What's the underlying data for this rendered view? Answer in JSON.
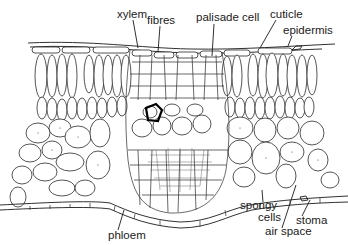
{
  "diagram": {
    "labels": [
      {
        "id": "xylem",
        "text": "xylem",
        "x": 117,
        "y": 18
      },
      {
        "id": "fibres",
        "text": "fibres",
        "x": 147,
        "y": 24
      },
      {
        "id": "palisade-cell",
        "text": "palisade cell",
        "x": 196,
        "y": 21
      },
      {
        "id": "cuticle",
        "text": "cuticle",
        "x": 270,
        "y": 18
      },
      {
        "id": "epidermis",
        "text": "epidermis",
        "x": 283,
        "y": 34
      },
      {
        "id": "spongy",
        "text": "spongy",
        "x": 240,
        "y": 209
      },
      {
        "id": "cells",
        "text": "cells",
        "x": 258,
        "y": 221
      },
      {
        "id": "stoma",
        "text": "stoma",
        "x": 296,
        "y": 224
      },
      {
        "id": "air-space",
        "text": "air space",
        "x": 265,
        "y": 235
      },
      {
        "id": "phloem",
        "text": "phloem",
        "x": 108,
        "y": 239
      }
    ],
    "colors": {
      "line": "#1a1a1a",
      "background": "#ffffff"
    }
  }
}
